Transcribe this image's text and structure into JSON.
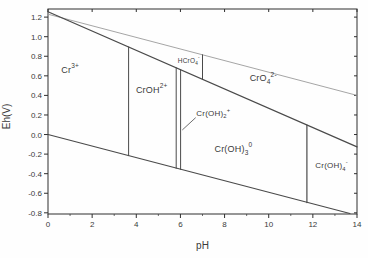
{
  "chart_data": {
    "type": "line",
    "title": "",
    "xlabel": "pH",
    "ylabel": "Eh(V)",
    "xlim": [
      0,
      14
    ],
    "ylim": [
      -0.8,
      1.2
    ],
    "ylim_draw": [
      -0.812,
      1.283
    ],
    "grid": false,
    "legend": "none",
    "axis_color": "#2f2f2f",
    "text_color": "#3a3a3a",
    "x_ticks": [
      {
        "v": 0,
        "l": "0"
      },
      {
        "v": 2,
        "l": "2"
      },
      {
        "v": 4,
        "l": "4"
      },
      {
        "v": 6,
        "l": "6"
      },
      {
        "v": 8,
        "l": "8"
      },
      {
        "v": 10,
        "l": "10"
      },
      {
        "v": 12,
        "l": "12"
      },
      {
        "v": 14,
        "l": "14"
      }
    ],
    "x_minor_ticks": [
      1,
      3,
      5,
      7,
      9,
      11,
      13
    ],
    "y_ticks": [
      {
        "v": 1.2,
        "l": "1.2"
      },
      {
        "v": 1.0,
        "l": "1.0"
      },
      {
        "v": 0.8,
        "l": "0.8"
      },
      {
        "v": 0.6,
        "l": "0.6"
      },
      {
        "v": 0.4,
        "l": "0.4"
      },
      {
        "v": 0.2,
        "l": "0.2"
      },
      {
        "v": 0.0,
        "l": "0.0"
      },
      {
        "v": -0.2,
        "l": "-0.2"
      },
      {
        "v": -0.4,
        "l": "-0.4"
      },
      {
        "v": -0.6,
        "l": "-0.6"
      },
      {
        "v": -0.8,
        "l": "-0.8"
      }
    ],
    "series": [
      {
        "name": "o2-water-line",
        "points": [
          [
            0,
            1.23
          ],
          [
            14,
            0.4
          ]
        ],
        "color": "#9b9b9b",
        "width": 0.9
      },
      {
        "name": "h2-water-line",
        "points": [
          [
            0,
            0.0
          ],
          [
            13.68,
            -0.807
          ]
        ],
        "color": "#4a4a4a",
        "width": 1.2
      },
      {
        "name": "cr6-cr3-redox-boundary",
        "points": [
          [
            0,
            1.255
          ],
          [
            14,
            -0.126
          ]
        ],
        "color": "#4a4a4a",
        "width": 1.2
      },
      {
        "name": "cr3-croh2-boundary",
        "points": [
          [
            3.65,
            0.895
          ],
          [
            3.65,
            -0.216
          ]
        ],
        "color": "#4a4a4a",
        "width": 1
      },
      {
        "name": "croh2-croh2plus-boundary",
        "points": [
          [
            5.81,
            0.682
          ],
          [
            5.81,
            -0.345
          ]
        ],
        "color": "#4a4a4a",
        "width": 1
      },
      {
        "name": "croh2plus-croh3-boundary",
        "points": [
          [
            6.01,
            0.662
          ],
          [
            6.01,
            -0.356
          ]
        ],
        "color": "#4a4a4a",
        "width": 1
      },
      {
        "name": "hcro4-cro4-boundary",
        "points": [
          [
            7.0,
            0.565
          ],
          [
            7.0,
            0.815
          ]
        ],
        "color": "#4a4a4a",
        "width": 1
      },
      {
        "name": "croh3-croh4-boundary",
        "points": [
          [
            11.73,
            0.098
          ],
          [
            11.73,
            -0.696
          ]
        ],
        "color": "#4a4a4a",
        "width": 1.2
      },
      {
        "name": "croh2plus-leader-line",
        "points": [
          [
            6.1,
            0.05
          ],
          [
            6.68,
            0.17
          ]
        ],
        "color": "#4a4a4a",
        "width": 0.8
      }
    ],
    "region_labels": [
      {
        "name": "cr3-label",
        "x": 1.0,
        "y": 0.63,
        "base": "Cr",
        "sub": "",
        "sup": "3+",
        "size": 9,
        "anchor": "middle"
      },
      {
        "name": "croh2-label",
        "x": 4.7,
        "y": 0.43,
        "base": "CrOH",
        "sub": "",
        "sup": "2+",
        "size": 9,
        "anchor": "middle"
      },
      {
        "name": "hcro4-label",
        "x": 6.38,
        "y": 0.735,
        "base": "HCrO",
        "sub": "4",
        "sup": "-",
        "size": 6.5,
        "anchor": "middle"
      },
      {
        "name": "cro4-label",
        "x": 9.75,
        "y": 0.545,
        "base": "CrO",
        "sub": "4",
        "sup": "2-",
        "size": 9,
        "anchor": "middle"
      },
      {
        "name": "croh2plus-label",
        "x": 6.72,
        "y": 0.195,
        "base": "Cr(OH)",
        "sub": "2",
        "sup": "+",
        "size": 8,
        "anchor": "start"
      },
      {
        "name": "croh3-label",
        "x": 8.4,
        "y": -0.175,
        "base": "Cr(OH)",
        "sub": "3",
        "sup": "0",
        "size": 9,
        "anchor": "middle"
      },
      {
        "name": "croh4-label",
        "x": 12.85,
        "y": -0.345,
        "base": "Cr(OH)",
        "sub": "4",
        "sup": "-",
        "size": 8,
        "anchor": "middle"
      }
    ]
  }
}
